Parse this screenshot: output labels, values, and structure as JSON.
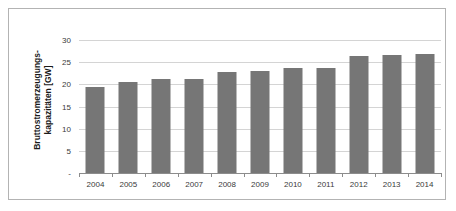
{
  "chart_data": {
    "type": "bar",
    "title": "",
    "subtitle": "",
    "xlabel": "",
    "ylabel": "Bruttostromerzeugungs-kapazitäten [GW]",
    "ylabel_lines": [
      "Bruttostromerzeugungs-",
      "kapazitäten [GW]"
    ],
    "categories": [
      "2004",
      "2005",
      "2006",
      "2007",
      "2008",
      "2009",
      "2010",
      "2011",
      "2012",
      "2013",
      "2014"
    ],
    "values": [
      19.3,
      20.5,
      21.2,
      21.2,
      22.7,
      23.1,
      23.7,
      23.8,
      26.3,
      26.7,
      26.8
    ],
    "ylim": [
      0,
      30
    ],
    "y_ticks": [
      0,
      5,
      10,
      15,
      20,
      25,
      30
    ],
    "y_tick_labels": [
      "-",
      "5",
      "10",
      "15",
      "20",
      "25",
      "30"
    ],
    "grid": true,
    "grid_axis": "y",
    "legend": false,
    "legend_position": "none",
    "series": [
      {
        "name": "Bruttostromerzeugungskapazitäten",
        "color": "#767676",
        "values": [
          19.3,
          20.5,
          21.2,
          21.2,
          22.7,
          23.1,
          23.7,
          23.8,
          26.3,
          26.7,
          26.8
        ]
      }
    ],
    "colors": {
      "bar": "#767676",
      "gridline": "#d4d4d4",
      "axis": "#8c8c8c",
      "frame": "#b3b3b3",
      "text": "#3a3a3a",
      "background": "#ffffff"
    }
  }
}
